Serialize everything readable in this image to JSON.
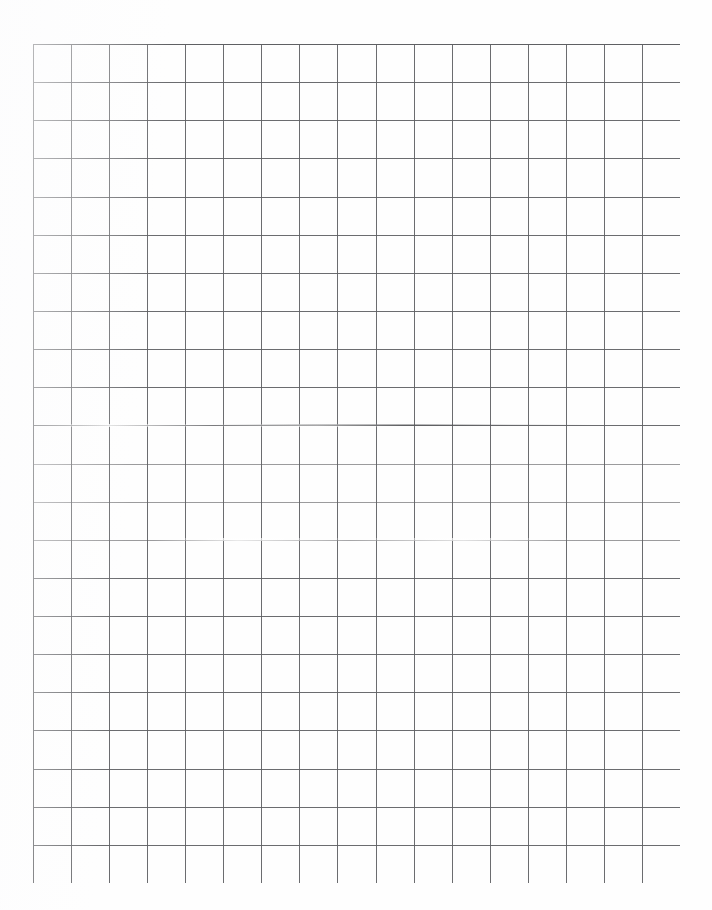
{
  "document": {
    "kind": "scanned-graph-paper",
    "title": "Blank grid paper sheet",
    "page_width": 712,
    "page_height": 910,
    "background_color": "#ffffff",
    "paper_color": "#fefefe"
  },
  "grid": {
    "columns": 17,
    "rows": 22,
    "cell_width": 38.06,
    "cell_height": 38.14,
    "origin_x": 33,
    "origin_y": 44,
    "grid_width": 647,
    "grid_height": 839,
    "line_color": "#5f6063",
    "edge_line_color": "#55575a",
    "line_width": 1,
    "has_content": false,
    "content_text": ""
  },
  "margins": {
    "left": 33,
    "top": 44,
    "right": 32,
    "bottom": 27
  },
  "scan_artifacts": {
    "faded_rows": [
      11,
      12,
      13
    ],
    "note": ""
  }
}
